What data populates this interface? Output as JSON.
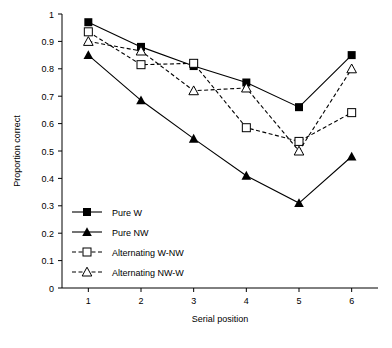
{
  "chart_data": {
    "type": "line",
    "title": "",
    "xlabel": "Serial position",
    "ylabel": "Proportion correct",
    "categories": [
      "1",
      "2",
      "3",
      "4",
      "5",
      "6"
    ],
    "x": [
      1,
      2,
      3,
      4,
      5,
      6
    ],
    "xlim": [
      0.5,
      6.5
    ],
    "ylim": [
      0,
      1
    ],
    "yticks": [
      "0",
      "0.1",
      "0.2",
      "0.3",
      "0.4",
      "0.5",
      "0.6",
      "0.7",
      "0.8",
      "0.9",
      "1"
    ],
    "ytick_values": [
      0,
      0.1,
      0.2,
      0.3,
      0.4,
      0.5,
      0.6,
      0.7,
      0.8,
      0.9,
      1
    ],
    "grid": false,
    "legend_position": "lower-left-inside",
    "series": [
      {
        "name": "Pure W",
        "values": [
          0.97,
          0.88,
          0.81,
          0.75,
          0.66,
          0.85
        ],
        "marker": "filled-square",
        "line": "solid",
        "color": "#000000"
      },
      {
        "name": "Pure NW",
        "values": [
          0.85,
          0.685,
          0.545,
          0.41,
          0.31,
          0.48
        ],
        "marker": "filled-triangle",
        "line": "solid",
        "color": "#000000"
      },
      {
        "name": "Alternating W-NW",
        "values": [
          0.935,
          0.815,
          0.82,
          0.585,
          0.535,
          0.64
        ],
        "marker": "open-square",
        "line": "dashed",
        "color": "#000000"
      },
      {
        "name": "Alternating NW-W",
        "values": [
          0.9,
          0.865,
          0.72,
          0.73,
          0.5,
          0.8
        ],
        "marker": "open-triangle",
        "line": "dashed",
        "color": "#000000"
      }
    ]
  }
}
